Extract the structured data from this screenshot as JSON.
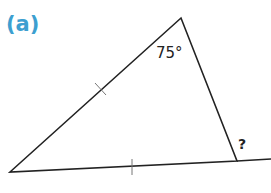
{
  "part_label": "(a)",
  "angle_label": "75°",
  "unknown_label": "?",
  "colors": {
    "part_label": "#3d9fd0",
    "lines": "#222222",
    "ticks": "#777777"
  },
  "shapes": {
    "triangle": {
      "vertices": [
        [
          10,
          172
        ],
        [
          181,
          18
        ],
        [
          237,
          161
        ]
      ]
    },
    "extended_line": {
      "from": [
        237,
        161
      ],
      "to": [
        271,
        159
      ]
    },
    "tick_marks": [
      {
        "edge": "left",
        "at": [
          100,
          89
        ]
      },
      {
        "edge": "bottom",
        "at": [
          132,
          166
        ]
      }
    ]
  }
}
